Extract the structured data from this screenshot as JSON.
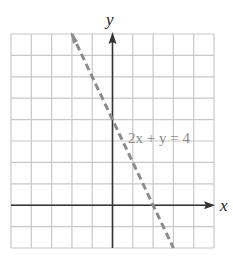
{
  "chart_data": {
    "type": "line",
    "title": "",
    "xlabel": "x",
    "ylabel": "y",
    "xlim": [
      -5,
      5
    ],
    "ylim": [
      -2,
      8
    ],
    "grid": true,
    "grid_step": 1,
    "series": [
      {
        "name": "2x + y = 4",
        "style": "dashed",
        "color": "#8c8c8c",
        "equation": "2x + y = 4",
        "x": [
          -2,
          3
        ],
        "y": [
          8,
          -2
        ]
      }
    ],
    "annotations": [
      {
        "text": "2x + y = 4",
        "x": 0.2,
        "y": 4.3
      }
    ],
    "legend": "none"
  },
  "labels": {
    "x_axis": "x",
    "y_axis": "y",
    "equation": "2x + y = 4"
  },
  "colors": {
    "grid": "#c8c8c8",
    "axis": "#333333",
    "line": "#8c8c8c",
    "equation_text": "#8a8a8a"
  }
}
